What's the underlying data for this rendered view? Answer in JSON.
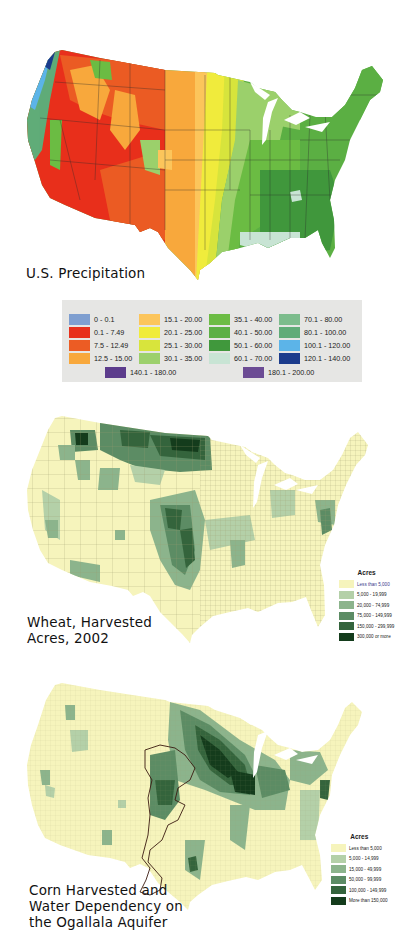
{
  "precipitation": {
    "caption": "U.S. Precipitation",
    "legend": [
      {
        "label": "0 - 0.1",
        "color": "#7f9fd0"
      },
      {
        "label": "0.1 - 7.49",
        "color": "#e8301c"
      },
      {
        "label": "7.5 - 12.49",
        "color": "#ec5c24"
      },
      {
        "label": "12.5 - 15.00",
        "color": "#f8a83c"
      },
      {
        "label": "15.1 - 20.00",
        "color": "#fcc55c"
      },
      {
        "label": "20.1 - 25.00",
        "color": "#f0ec3c"
      },
      {
        "label": "25.1 - 30.00",
        "color": "#d8e43c"
      },
      {
        "label": "30.1 - 35.00",
        "color": "#9cd06c"
      },
      {
        "label": "35.1 - 40.00",
        "color": "#6cbc44"
      },
      {
        "label": "40.1 - 50.00",
        "color": "#5cb044"
      },
      {
        "label": "50.1 - 60.00",
        "color": "#40983c"
      },
      {
        "label": "60.1 - 70.00",
        "color": "#c8e4d4"
      },
      {
        "label": "70.1 - 80.00",
        "color": "#7cbc8c"
      },
      {
        "label": "80.1 - 100.00",
        "color": "#60ac78"
      },
      {
        "label": "100.1 - 120.00",
        "color": "#5cb4e8"
      },
      {
        "label": "120.1 - 140.00",
        "color": "#1c3c8c"
      },
      {
        "label": "140.1 - 180.00",
        "color": "#5c3c8c"
      },
      {
        "label": "180.1 - 200.00",
        "color": "#6c4c94"
      }
    ]
  },
  "wheat": {
    "caption_line1": "Wheat, Harvested",
    "caption_line2": "Acres, 2002",
    "legend_title": "Acres",
    "legend": [
      {
        "label": "Less than 5,000",
        "color": "#f6f4bc"
      },
      {
        "label": "5,000 - 19,999",
        "color": "#b4d0a8"
      },
      {
        "label": "20,000 - 74,999",
        "color": "#8cb48c"
      },
      {
        "label": "75,000 - 149,999",
        "color": "#5c8c64"
      },
      {
        "label": "150,000 - 299,999",
        "color": "#34643c"
      },
      {
        "label": "300,000 or more",
        "color": "#143c1c"
      }
    ]
  },
  "corn": {
    "caption_line1": "Corn Harvested and",
    "caption_line2": "Water Dependency on",
    "caption_line3": "the Ogallala Aquifer",
    "legend_title": "Acres",
    "legend": [
      {
        "label": "Less than 5,000",
        "color": "#f6f4bc"
      },
      {
        "label": "5,000 - 14,999",
        "color": "#b4d0a8"
      },
      {
        "label": "15,000 - 49,999",
        "color": "#8cb48c"
      },
      {
        "label": "50,000 - 99,999",
        "color": "#5c8c64"
      },
      {
        "label": "100,000 - 149,999",
        "color": "#34643c"
      },
      {
        "label": "More than 150,000",
        "color": "#143c1c"
      }
    ]
  }
}
